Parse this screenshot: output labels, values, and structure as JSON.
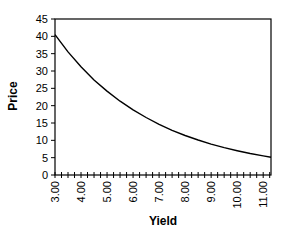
{
  "chart_data": {
    "type": "line",
    "title": "",
    "xlabel": "Yield",
    "ylabel": "Price",
    "xlim": [
      3.0,
      11.3
    ],
    "ylim": [
      0,
      45
    ],
    "grid": false,
    "legend": null,
    "y_ticks": [
      0,
      5,
      10,
      15,
      20,
      25,
      30,
      35,
      40,
      45
    ],
    "x_tick_labels": [
      "3.00",
      "4.00",
      "5.00",
      "6.00",
      "7.00",
      "8.00",
      "9.00",
      "10.00",
      "11.00"
    ],
    "x_minor_step": 0.25,
    "series": [
      {
        "name": "Price",
        "color": "#000000",
        "x": [
          3.0,
          3.5,
          4.0,
          4.5,
          5.0,
          5.5,
          6.0,
          6.5,
          7.0,
          7.5,
          8.0,
          8.5,
          9.0,
          9.5,
          10.0,
          10.5,
          11.0,
          11.3
        ],
        "y": [
          40.5,
          35.5,
          31.2,
          27.4,
          24.2,
          21.3,
          18.8,
          16.6,
          14.6,
          12.9,
          11.4,
          10.1,
          8.9,
          7.9,
          7.0,
          6.2,
          5.5,
          5.1
        ]
      }
    ]
  }
}
